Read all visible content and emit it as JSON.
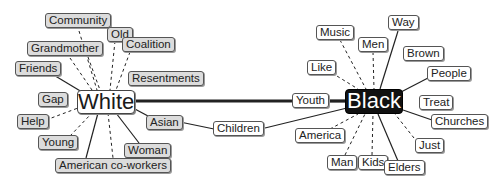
{
  "diagram": {
    "hubs": {
      "white": {
        "label": "White",
        "fill": "#ffffff",
        "text_color": "#1a1a1a"
      },
      "black": {
        "label": "Black",
        "fill": "#111111",
        "text_color": "#ffffff"
      }
    },
    "hub_link": {
      "from": "White",
      "to": "Black",
      "style": "thick-solid"
    },
    "white_terms": [
      {
        "label": "Community",
        "link": "dashed"
      },
      {
        "label": "Old",
        "link": "dashed"
      },
      {
        "label": "Grandmother",
        "link": "dashed"
      },
      {
        "label": "Coalition",
        "link": "dashed"
      },
      {
        "label": "Friends",
        "link": "solid"
      },
      {
        "label": "Resentments",
        "link": "dashed"
      },
      {
        "label": "Gap",
        "link": "none"
      },
      {
        "label": "Help",
        "link": "dashed"
      },
      {
        "label": "Asian",
        "link": "solid"
      },
      {
        "label": "Young",
        "link": "dashed"
      },
      {
        "label": "Woman",
        "link": "solid"
      },
      {
        "label": "American co-workers",
        "link": "solid+dashed"
      }
    ],
    "shared_terms": [
      {
        "label": "Children",
        "links": [
          "Asian",
          "Black"
        ]
      }
    ],
    "black_terms": [
      {
        "label": "Way",
        "link": "solid"
      },
      {
        "label": "Music",
        "link": "dashed"
      },
      {
        "label": "Men",
        "link": "dashed"
      },
      {
        "label": "Brown",
        "link": "none"
      },
      {
        "label": "Like",
        "link": "dashed"
      },
      {
        "label": "People",
        "link": "solid"
      },
      {
        "label": "Youth",
        "link": "solid"
      },
      {
        "label": "Treat",
        "link": "none"
      },
      {
        "label": "Churches",
        "link": "solid"
      },
      {
        "label": "America",
        "link": "dashed"
      },
      {
        "label": "Just",
        "link": "dashed"
      },
      {
        "label": "Man",
        "link": "dashed"
      },
      {
        "label": "Kids",
        "link": "dashed"
      },
      {
        "label": "Elders",
        "link": "solid"
      }
    ],
    "colors": {
      "white_side_node_fill": "#dcdcdc",
      "black_side_node_fill": "#ffffff",
      "edge": "#222222"
    }
  }
}
